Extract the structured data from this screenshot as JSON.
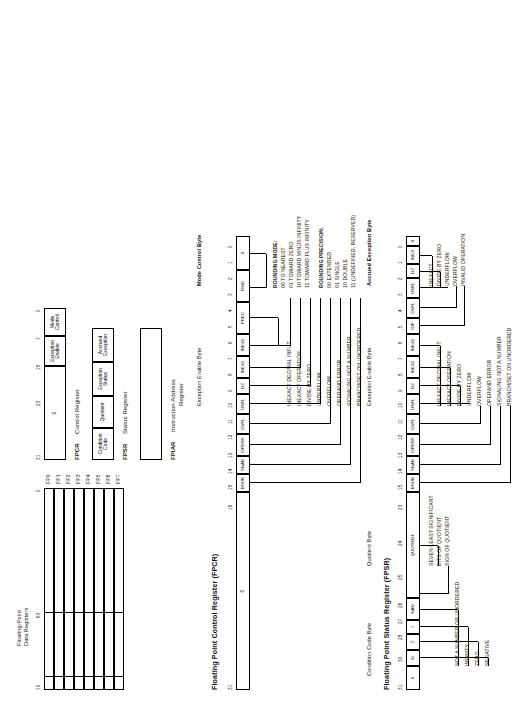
{
  "figure": {
    "orientation_note": "landscape"
  },
  "fp_data_registers": {
    "group_label": "Floating-Point\nData Registers",
    "group_label_line1": "Floating-Point",
    "group_label_line2": "Data Registers",
    "register_names": [
      "FP0",
      "FP1",
      "FP2",
      "FP3",
      "FP4",
      "FP5",
      "FP6",
      "FP7"
    ],
    "bit_ticks": [
      "79",
      "63",
      "0"
    ],
    "field_ticks_desc": "sign/exponent boundary at 79-64, mantissa 63-0"
  },
  "fpcr": {
    "mnemonic": "FPCR",
    "name": "Control Register",
    "full_name": "Floating Point  Control  Register  (FPCR)",
    "bit_ticks": [
      "31",
      "23",
      "15",
      "7",
      "0"
    ],
    "zero_field": "0",
    "byte_cells": [
      {
        "label_line1": "Exception",
        "label_line2": "Enable"
      },
      {
        "label_line1": "Mode",
        "label_line2": "Control"
      }
    ],
    "bit_numbers": [
      "15",
      "14",
      "13",
      "12",
      "11",
      "10",
      "9",
      "8",
      "7",
      "6",
      "5",
      "4",
      "3",
      "2",
      "1",
      "0"
    ],
    "bit_fields": [
      "BSUN",
      "SNAN",
      "OPERR",
      "OVFL",
      "UNFL",
      "DZ",
      "INEX2",
      "INEX1",
      "PREC",
      "PREC",
      "RND",
      "RND",
      "0",
      "0",
      "0",
      "0"
    ],
    "field_cells": [
      "BSUN",
      "SNAN",
      "OPERR",
      "OVFL",
      "UNFL",
      "DZ",
      "INEX2",
      "INEX1",
      "PREC",
      "RND",
      "0"
    ],
    "mode_control_byte_label": "Mode Control Byte",
    "exception_enable_byte_label": "Exception  Enable  Byte",
    "rounding_mode": {
      "heading": "ROUNDING MODE:",
      "options": [
        "00 TO NEAREST",
        "01 TOWARD ZERO",
        "10 TOWARD MINUS INFINITY",
        "11 TOWARD PLUS INFINITY"
      ]
    },
    "rounding_precision": {
      "heading": "ROUNDING PRECISION:",
      "options": [
        "00 EXTENDED",
        "01 SINGLE",
        "10 DOUBLE",
        "11 (UNDEFINED, RESERVED)"
      ]
    },
    "exception_descriptions": [
      "INEXACT DECIMAL INPUT",
      "INEXACT OPERATION",
      "DIVIDE BY ZERO",
      "UNDERFLOW",
      "OVERFLOW",
      "OPERAND ERROR",
      "SIGNALING NOT A NUMBER",
      "BRANCH/SET ON UNORDERED"
    ]
  },
  "fpsr": {
    "mnemonic": "FPSR",
    "name": "Status Register",
    "full_name": "Floating Point  Status  Register  (FPSR)",
    "bit_ticks": [
      "31",
      "27",
      "23",
      "20",
      "16",
      "15",
      "7",
      "0"
    ],
    "byte_cells": [
      {
        "label_line1": "Condition",
        "label_line2": "Code"
      },
      {
        "label_line1": "Quotient",
        "label_line2": ""
      },
      {
        "label_line1": "Exception",
        "label_line2": "Status"
      },
      {
        "label_line1": "Accrued",
        "label_line2": "Exception"
      }
    ],
    "cc_bits": [
      "0",
      "N",
      "Z",
      "I",
      "NAN"
    ],
    "cc_bit_ticks": [
      "31",
      "30",
      "28",
      "27",
      "26",
      "25",
      "24",
      "23"
    ],
    "bit_numbers": [
      "15",
      "14",
      "13",
      "12",
      "11",
      "10",
      "9",
      "8",
      "7",
      "6",
      "5",
      "4",
      "3",
      "2",
      "1",
      "0"
    ],
    "field_cells": [
      "BSUN",
      "SNAN",
      "OPERR",
      "OVFL",
      "UNFL",
      "DZ",
      "INEX2",
      "INEX1",
      "IOP",
      "OVFL",
      "UNFL",
      "DZ",
      "INEX",
      "0"
    ],
    "quotient_byte_label": "Quotient  Byte",
    "quotient_notes": [
      "SEVEN LEAST SIGNIFICANT",
      "BITS OF QUOTIENT",
      "SIGN OF QUOTIENT"
    ],
    "condition_code_byte_label": "Condition Code  Byte",
    "condition_code_notes": [
      "NOT A NUMBER OR UNORDERED",
      "INFINITY",
      "ZERO",
      "NEGATIVE"
    ],
    "exception_status_byte_label": "Exception  Enable  Byte",
    "accrued_exception_byte_label": "Accrued  Exception  Byte",
    "exception_descriptions": [
      "INEXACT DECIMAL INPUT",
      "INEXACT OPERATION",
      "DIVIDE BY ZERO",
      "UNDERFLOW",
      "OVERFLOW",
      "OPERAND ERROR",
      "SIGNALING NOT A NUMBER",
      "BRANCH/SET ON UNORDERED"
    ],
    "accrued_descriptions": [
      "INEXACT",
      "DIVIDE BY ZERO",
      "UNDERFLOW",
      "OVERFLOW",
      "INVALID OPERATION"
    ],
    "quotient_field_label": "QUOTIENT"
  },
  "fpiar": {
    "mnemonic": "FPIAR",
    "name_line1": "Instruction Address",
    "name_line2": "Register",
    "bit_ticks": [
      "31",
      "0"
    ]
  }
}
